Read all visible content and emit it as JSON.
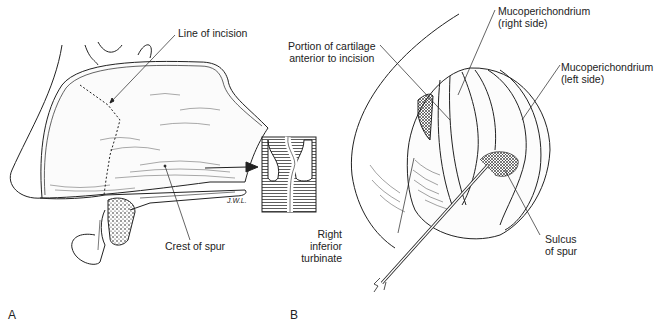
{
  "figure": {
    "panels": [
      {
        "id": "A",
        "label": "A"
      },
      {
        "id": "B",
        "label": "B"
      }
    ]
  },
  "panel_a": {
    "labels": {
      "line_of_incision": "Line of incision",
      "crest_of_spur": "Crest of spur",
      "signature": "J.W.L."
    }
  },
  "panel_b": {
    "labels": {
      "portion_line1": "Portion of cartilage",
      "portion_line2": "anterior to incision",
      "muco_right_line1": "Mucoperichondrium",
      "muco_right_line2": "(right side)",
      "muco_left_line1": "Mucoperichondrium",
      "muco_left_line2": "(left side)",
      "right_inferior_line1": "Right",
      "right_inferior_line2": "inferior",
      "right_inferior_line3": "turbinate",
      "sulcus_line1": "Sulcus",
      "sulcus_line2": "of spur"
    }
  }
}
